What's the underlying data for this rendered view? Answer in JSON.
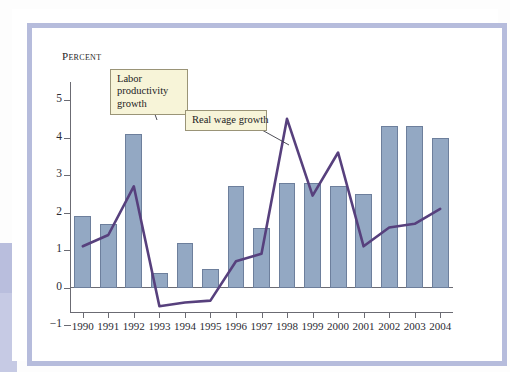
{
  "figure": {
    "axis_title": "Percent",
    "annotations": [
      {
        "id": "productivity",
        "text": "Labor productivity growth"
      },
      {
        "id": "realwage",
        "text": "Real wage growth"
      }
    ]
  },
  "colors": {
    "bar_fill": "#93a8c3",
    "bar_stroke": "#6d7f9c",
    "line": "#57407d",
    "axis": "#6b6b73",
    "frame": "#b6bcdc",
    "callout_fill": "#f7f4d8",
    "callout_stroke": "#9a9477"
  },
  "chart_data": {
    "type": "bar",
    "title": "",
    "subtitle": "",
    "xlabel": "",
    "ylabel": "Percent",
    "ylim": [
      -1,
      5
    ],
    "yticks": [
      -1,
      0,
      1,
      2,
      3,
      4,
      5
    ],
    "ytick_labels": [
      "−1",
      "0",
      "1",
      "2",
      "3",
      "4",
      "5"
    ],
    "grid": false,
    "legend_position": "annotations",
    "categories": [
      "1990",
      "1991",
      "1992",
      "1993",
      "1994",
      "1995",
      "1996",
      "1997",
      "1998",
      "1999",
      "2000",
      "2001",
      "2002",
      "2003",
      "2004"
    ],
    "series": [
      {
        "name": "Labor productivity growth",
        "type": "bar",
        "values": [
          1.9,
          1.7,
          4.1,
          0.4,
          1.2,
          0.5,
          2.7,
          1.6,
          2.8,
          2.8,
          2.7,
          2.5,
          4.3,
          4.3,
          4.0
        ]
      },
      {
        "name": "Real wage growth",
        "type": "line",
        "values": [
          1.1,
          1.4,
          2.7,
          -0.5,
          -0.4,
          -0.35,
          0.7,
          0.9,
          4.5,
          2.45,
          3.6,
          1.1,
          1.6,
          1.7,
          2.1
        ]
      }
    ]
  }
}
